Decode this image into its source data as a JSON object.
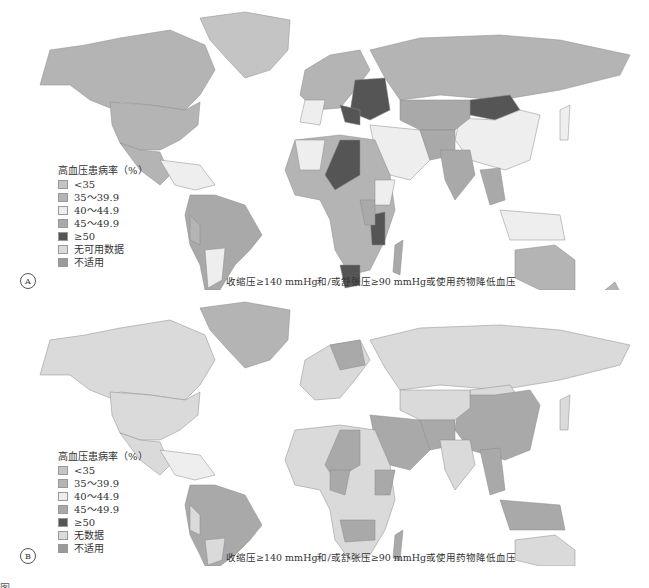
{
  "legend_title": "高血压患病率（%）",
  "footnote": "收缩压≥140 mmHg和/或舒张压≥90 mmHg或使用药物降低血压",
  "colors": {
    "lt35": "#c4c4c4",
    "c35_39": "#b4b4b4",
    "c40_44": "#eeeeee",
    "c45_49": "#a9a9a9",
    "ge50": "#555555",
    "nodata": "#dadada",
    "na": "#9a9a9a",
    "border": "#8a8a8a"
  },
  "panels": [
    {
      "label": "A",
      "legend": [
        {
          "label": "<35",
          "color": "#c4c4c4"
        },
        {
          "label": "35～39.9",
          "color": "#b4b4b4"
        },
        {
          "label": "40～44.9",
          "color": "#eeeeee"
        },
        {
          "label": "45～49.9",
          "color": "#a9a9a9"
        },
        {
          "label": "≥50",
          "color": "#555555"
        },
        {
          "label": "无可用数据",
          "color": "#dadada"
        },
        {
          "label": "不适用",
          "color": "#9a9a9a"
        }
      ]
    },
    {
      "label": "B",
      "legend": [
        {
          "label": "<35",
          "color": "#c4c4c4"
        },
        {
          "label": "35～39.9",
          "color": "#b4b4b4"
        },
        {
          "label": "40～44.9",
          "color": "#eeeeee"
        },
        {
          "label": "45～49.9",
          "color": "#a9a9a9"
        },
        {
          "label": "≥50",
          "color": "#555555"
        },
        {
          "label": "无数据",
          "color": "#dadada"
        },
        {
          "label": "不适用",
          "color": "#9a9a9a"
        }
      ]
    }
  ],
  "caption": "图"
}
